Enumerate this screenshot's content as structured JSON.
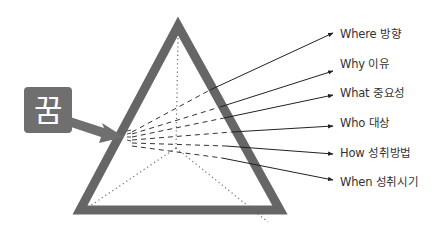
{
  "diagram": {
    "concept_box": {
      "label": "꿈",
      "color": "#6f6f6f"
    },
    "triangle": {
      "stroke_color": "#666666"
    },
    "labels": [
      {
        "text": "Where 방향"
      },
      {
        "text": "Why 이유"
      },
      {
        "text": "What 중요성"
      },
      {
        "text": "Who 대상"
      },
      {
        "text": "How 성취방법"
      },
      {
        "text": "When 성취시기"
      }
    ]
  }
}
